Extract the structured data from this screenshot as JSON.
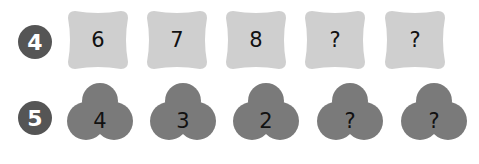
{
  "rows": [
    {
      "number": "4",
      "shape": "rounded-square",
      "color": "#cfcfcf",
      "items": [
        "6",
        "7",
        "8",
        "?",
        "?"
      ]
    },
    {
      "number": "5",
      "shape": "cloud",
      "color": "#7a7a7a",
      "items": [
        "4",
        "3",
        "2",
        "?",
        "?"
      ]
    }
  ],
  "badge_color": "#555555"
}
